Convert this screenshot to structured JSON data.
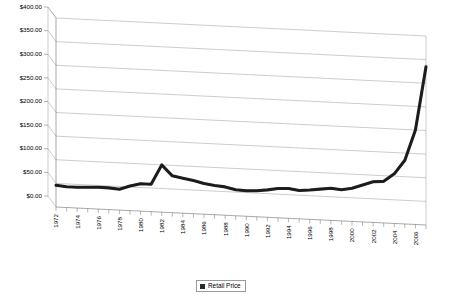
{
  "chart_data": {
    "type": "line",
    "title": "",
    "subtitle": "",
    "xlabel": "",
    "ylabel": "",
    "ylim": [
      0,
      400
    ],
    "ytick_step": 50,
    "grid": true,
    "three_d": true,
    "legend_position": "bottom-center",
    "y_tick_labels": [
      "$0.00",
      "$50.00",
      "$100.00",
      "$150.00",
      "$200.00",
      "$250.00",
      "$300.00",
      "$350.00",
      "$400.00"
    ],
    "y_tick_values": [
      0,
      50,
      100,
      150,
      200,
      250,
      300,
      350,
      400
    ],
    "x_tick_labels": [
      "1972",
      "1974",
      "1976",
      "1978",
      "1980",
      "1982",
      "1984",
      "1986",
      "1988",
      "1990",
      "1992",
      "1994",
      "1996",
      "1998",
      "2000",
      "2002",
      "2004",
      "2006"
    ],
    "xlim": [
      1972,
      2007
    ],
    "categories": [
      1972,
      1973,
      1974,
      1975,
      1976,
      1977,
      1978,
      1979,
      1980,
      1981,
      1982,
      1983,
      1984,
      1985,
      1986,
      1987,
      1988,
      1989,
      1990,
      1991,
      1992,
      1993,
      1994,
      1995,
      1996,
      1997,
      1998,
      1999,
      2000,
      2001,
      2002,
      2003,
      2004,
      2005,
      2006,
      2007
    ],
    "series": [
      {
        "name": "Retail Price",
        "color": "#1a1a1a",
        "values": [
          46,
          44,
          44,
          45,
          46,
          46,
          44,
          52,
          58,
          58,
          100,
          78,
          74,
          70,
          65,
          62,
          60,
          55,
          54,
          55,
          58,
          62,
          63,
          60,
          62,
          65,
          68,
          66,
          70,
          78,
          86,
          88,
          105,
          135,
          200,
          335
        ]
      }
    ]
  },
  "legend": {
    "entries": [
      {
        "label": "Retail Price",
        "color": "#2b2b2b"
      }
    ]
  }
}
